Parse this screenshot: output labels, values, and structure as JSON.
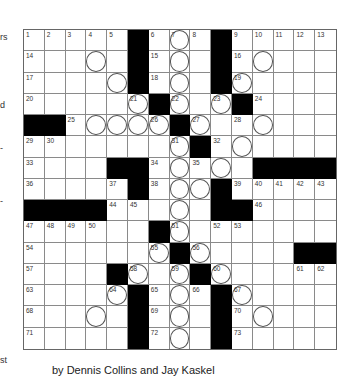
{
  "margin_fragments": [
    {
      "text": "rs",
      "top": 32
    },
    {
      "text": "d",
      "top": 100
    },
    {
      "text": "-",
      "top": 143
    },
    {
      "text": "-",
      "top": 196
    },
    {
      "text": "st",
      "top": 355
    }
  ],
  "puzzle": {
    "rows": 15,
    "cols": 15,
    "grid": [
      [
        [
          "1",
          0
        ],
        [
          "2",
          0
        ],
        [
          "3",
          0
        ],
        [
          "4",
          0
        ],
        [
          "5",
          0
        ],
        [
          "#",
          0
        ],
        [
          "6",
          0
        ],
        [
          "7",
          1
        ],
        [
          "8",
          0
        ],
        [
          "#",
          0
        ],
        [
          "9",
          0
        ],
        [
          "10",
          0
        ],
        [
          "11",
          0
        ],
        [
          "12",
          0
        ],
        [
          "13",
          0
        ]
      ],
      [
        [
          "14",
          0
        ],
        [
          "",
          0
        ],
        [
          "",
          0
        ],
        [
          "",
          1
        ],
        [
          "",
          0
        ],
        [
          "#",
          0
        ],
        [
          "15",
          0
        ],
        [
          "",
          1
        ],
        [
          "",
          0
        ],
        [
          "#",
          0
        ],
        [
          "16",
          0
        ],
        [
          "",
          1
        ],
        [
          "",
          0
        ],
        [
          "",
          0
        ],
        [
          "",
          0
        ]
      ],
      [
        [
          "17",
          0
        ],
        [
          "",
          0
        ],
        [
          "",
          0
        ],
        [
          "",
          0
        ],
        [
          "",
          1
        ],
        [
          "#",
          0
        ],
        [
          "18",
          0
        ],
        [
          "",
          1
        ],
        [
          "",
          0
        ],
        [
          "#",
          0
        ],
        [
          "19",
          1
        ],
        [
          "",
          0
        ],
        [
          "",
          0
        ],
        [
          "",
          0
        ],
        [
          "",
          0
        ]
      ],
      [
        [
          "20",
          0
        ],
        [
          "",
          0
        ],
        [
          "",
          0
        ],
        [
          "",
          0
        ],
        [
          "",
          0
        ],
        [
          "21",
          1
        ],
        [
          "#",
          0
        ],
        [
          "22",
          1
        ],
        [
          "",
          0
        ],
        [
          "23",
          1
        ],
        [
          "#",
          0
        ],
        [
          "24",
          0
        ],
        [
          "",
          0
        ],
        [
          "",
          0
        ],
        [
          "",
          0
        ]
      ],
      [
        [
          "#",
          0
        ],
        [
          "#",
          0
        ],
        [
          "25",
          0
        ],
        [
          "",
          1
        ],
        [
          "",
          1
        ],
        [
          "",
          1
        ],
        [
          "26",
          1
        ],
        [
          "#",
          0
        ],
        [
          "27",
          1
        ],
        [
          "",
          0
        ],
        [
          "28",
          0
        ],
        [
          "",
          1
        ],
        [
          "",
          0
        ],
        [
          "",
          0
        ],
        [
          "",
          0
        ]
      ],
      [
        [
          "29",
          0
        ],
        [
          "30",
          0
        ],
        [
          "",
          0
        ],
        [
          "",
          0
        ],
        [
          "",
          0
        ],
        [
          "",
          0
        ],
        [
          "",
          0
        ],
        [
          "31",
          1
        ],
        [
          "#",
          0
        ],
        [
          "32",
          0
        ],
        [
          "",
          1
        ],
        [
          "",
          0
        ],
        [
          "",
          0
        ],
        [
          "",
          0
        ],
        [
          "",
          0
        ]
      ],
      [
        [
          "33",
          0
        ],
        [
          "",
          0
        ],
        [
          "",
          0
        ],
        [
          "",
          0
        ],
        [
          "#",
          0
        ],
        [
          "#",
          0
        ],
        [
          "34",
          0
        ],
        [
          "",
          1
        ],
        [
          "35",
          0
        ],
        [
          "",
          1
        ],
        [
          "",
          0
        ],
        [
          "#",
          0
        ],
        [
          "#",
          0
        ],
        [
          "#",
          0
        ],
        [
          "#",
          0
        ]
      ],
      [
        [
          "36",
          0
        ],
        [
          "",
          0
        ],
        [
          "",
          0
        ],
        [
          "",
          0
        ],
        [
          "37",
          0
        ],
        [
          "#",
          0
        ],
        [
          "38",
          0
        ],
        [
          "",
          1
        ],
        [
          "",
          1
        ],
        [
          "#",
          0
        ],
        [
          "39",
          0
        ],
        [
          "40",
          0
        ],
        [
          "41",
          0
        ],
        [
          "42",
          0
        ],
        [
          "43",
          0
        ]
      ],
      [
        [
          "#",
          0
        ],
        [
          "#",
          0
        ],
        [
          "#",
          0
        ],
        [
          "#",
          0
        ],
        [
          "44",
          0
        ],
        [
          "45",
          0
        ],
        [
          "",
          0
        ],
        [
          "",
          1
        ],
        [
          "",
          0
        ],
        [
          "#",
          0
        ],
        [
          "#",
          0
        ],
        [
          "46",
          0
        ],
        [
          "",
          0
        ],
        [
          "",
          0
        ],
        [
          "",
          0
        ]
      ],
      [
        [
          "47",
          0
        ],
        [
          "48",
          0
        ],
        [
          "49",
          0
        ],
        [
          "50",
          0
        ],
        [
          "",
          0
        ],
        [
          "",
          0
        ],
        [
          "#",
          0
        ],
        [
          "51",
          1
        ],
        [
          "",
          0
        ],
        [
          "52",
          0
        ],
        [
          "53",
          0
        ],
        [
          "",
          0
        ],
        [
          "",
          0
        ],
        [
          "",
          0
        ],
        [
          "",
          0
        ]
      ],
      [
        [
          "54",
          0
        ],
        [
          "",
          0
        ],
        [
          "",
          0
        ],
        [
          "",
          0
        ],
        [
          "",
          0
        ],
        [
          "",
          0
        ],
        [
          "55",
          1
        ],
        [
          "#",
          0
        ],
        [
          "56",
          1
        ],
        [
          "",
          0
        ],
        [
          "",
          0
        ],
        [
          "",
          0
        ],
        [
          "",
          0
        ],
        [
          "#",
          0
        ],
        [
          "#",
          0
        ]
      ],
      [
        [
          "57",
          0
        ],
        [
          "",
          0
        ],
        [
          "",
          0
        ],
        [
          "",
          0
        ],
        [
          "#",
          0
        ],
        [
          "58",
          1
        ],
        [
          "",
          0
        ],
        [
          "59",
          1
        ],
        [
          "#",
          0
        ],
        [
          "60",
          1
        ],
        [
          "",
          0
        ],
        [
          "",
          0
        ],
        [
          "",
          0
        ],
        [
          "61",
          0
        ],
        [
          "62",
          0
        ]
      ],
      [
        [
          "63",
          0
        ],
        [
          "",
          0
        ],
        [
          "",
          0
        ],
        [
          "",
          0
        ],
        [
          "64",
          1
        ],
        [
          "#",
          0
        ],
        [
          "65",
          0
        ],
        [
          "",
          1
        ],
        [
          "66",
          0
        ],
        [
          "#",
          0
        ],
        [
          "67",
          1
        ],
        [
          "",
          0
        ],
        [
          "",
          0
        ],
        [
          "",
          0
        ],
        [
          "",
          0
        ]
      ],
      [
        [
          "68",
          0
        ],
        [
          "",
          0
        ],
        [
          "",
          0
        ],
        [
          "",
          1
        ],
        [
          "",
          0
        ],
        [
          "#",
          0
        ],
        [
          "69",
          0
        ],
        [
          "",
          1
        ],
        [
          "",
          0
        ],
        [
          "#",
          0
        ],
        [
          "70",
          0
        ],
        [
          "",
          1
        ],
        [
          "",
          0
        ],
        [
          "",
          0
        ],
        [
          "",
          0
        ]
      ],
      [
        [
          "71",
          0
        ],
        [
          "",
          0
        ],
        [
          "",
          0
        ],
        [
          "",
          0
        ],
        [
          "",
          0
        ],
        [
          "#",
          0
        ],
        [
          "72",
          0
        ],
        [
          "",
          1
        ],
        [
          "",
          0
        ],
        [
          "#",
          0
        ],
        [
          "73",
          0
        ],
        [
          "",
          0
        ],
        [
          "",
          0
        ],
        [
          "",
          0
        ],
        [
          "",
          0
        ]
      ]
    ]
  },
  "byline": "by Dennis Collins and Jay Kaskel"
}
